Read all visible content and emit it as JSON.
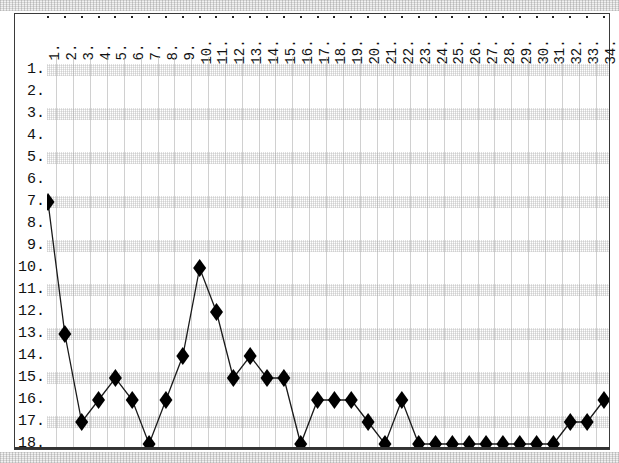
{
  "chart_data": {
    "type": "line",
    "title": "",
    "subtitle": "",
    "xlabel": "",
    "ylabel": "",
    "grid": true,
    "legend": null,
    "y_axis_inverted": true,
    "xlim": [
      1,
      34
    ],
    "ylim": [
      1,
      18
    ],
    "x_tick_labels": [
      "1.",
      "2.",
      "3.",
      "4.",
      "5.",
      "6.",
      "7.",
      "8.",
      "9.",
      "10.",
      "11.",
      "12.",
      "13.",
      "14.",
      "15.",
      "16.",
      "17.",
      "18.",
      "19.",
      "20.",
      "21.",
      "22.",
      "23.",
      "24.",
      "25.",
      "26.",
      "27.",
      "28.",
      "29.",
      "30.",
      "31.",
      "32.",
      "33.",
      "34."
    ],
    "y_tick_labels": [
      "1.",
      "2.",
      "3.",
      "4.",
      "5.",
      "6.",
      "7.",
      "8.",
      "9.",
      "10.",
      "11.",
      "12.",
      "13.",
      "14.",
      "15.",
      "16.",
      "17.",
      "18."
    ],
    "categories": [
      1,
      2,
      3,
      4,
      5,
      6,
      7,
      8,
      9,
      10,
      11,
      12,
      13,
      14,
      15,
      16,
      17,
      18,
      19,
      20,
      21,
      22,
      23,
      24,
      25,
      26,
      27,
      28,
      29,
      30,
      31,
      32,
      33,
      34
    ],
    "values": [
      7,
      13,
      17,
      16,
      15,
      16,
      18,
      16,
      14,
      10,
      12,
      15,
      14,
      15,
      15,
      18,
      16,
      16,
      16,
      17,
      18,
      16,
      18,
      18,
      18,
      18,
      18,
      18,
      18,
      18,
      18,
      17,
      17,
      16
    ],
    "series": [
      {
        "name": "rank",
        "marker": "diamond",
        "marker_color": "#000000",
        "line_color": "#1a1a1a",
        "values": [
          7,
          13,
          17,
          16,
          15,
          16,
          18,
          16,
          14,
          10,
          12,
          15,
          14,
          15,
          15,
          18,
          16,
          16,
          16,
          17,
          18,
          16,
          18,
          18,
          18,
          18,
          18,
          18,
          18,
          18,
          18,
          17,
          17,
          16
        ]
      }
    ],
    "colors": {
      "marker": "#000000",
      "line": "#1a1a1a",
      "grid_band": "#c8c8c8",
      "frame": "#3a3a3a",
      "background": "#ffffff",
      "text": "#111111"
    }
  }
}
